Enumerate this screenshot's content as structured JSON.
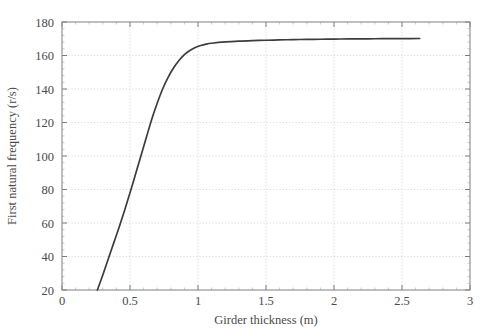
{
  "chart_data": {
    "type": "line",
    "title": "",
    "xlabel": "Girder thickness (m)",
    "ylabel": "First natural frequency (r/s)",
    "xlim": [
      0,
      3
    ],
    "ylim": [
      20,
      180
    ],
    "xticks": [
      "0",
      "0.5",
      "1",
      "1.5",
      "2",
      "2.5",
      "3"
    ],
    "xtick_values": [
      0,
      0.5,
      1,
      1.5,
      2,
      2.5,
      3
    ],
    "yticks": [
      "20",
      "40",
      "60",
      "80",
      "100",
      "120",
      "140",
      "160",
      "180"
    ],
    "ytick_values": [
      20,
      40,
      60,
      80,
      100,
      120,
      140,
      160,
      180
    ],
    "grid": true,
    "grid_style": "dotted",
    "legend": null,
    "series": [
      {
        "name": "First natural frequency",
        "x": [
          0.26,
          0.3,
          0.34,
          0.38,
          0.42,
          0.46,
          0.5,
          0.54,
          0.58,
          0.62,
          0.66,
          0.7,
          0.74,
          0.78,
          0.82,
          0.86,
          0.9,
          0.94,
          0.98,
          1.02,
          1.06,
          1.1,
          1.2,
          1.3,
          1.4,
          1.5,
          1.6,
          1.7,
          1.8,
          1.9,
          2.0,
          2.1,
          2.2,
          2.3,
          2.4,
          2.5,
          2.63
        ],
        "y": [
          20.0,
          29.0,
          38.5,
          48.0,
          57.5,
          67.5,
          78.0,
          89.0,
          100.0,
          111.0,
          122.0,
          131.5,
          140.0,
          147.0,
          152.5,
          157.0,
          160.5,
          163.0,
          164.8,
          166.0,
          166.8,
          167.3,
          168.1,
          168.6,
          168.9,
          169.1,
          169.3,
          169.5,
          169.6,
          169.7,
          169.8,
          169.9,
          169.95,
          170.0,
          170.05,
          170.1,
          170.15
        ]
      }
    ],
    "colors": {
      "curve": "#3d3d3d",
      "grid": "#c9c9c9",
      "frame": "#8a8a8a",
      "text": "#4a4a4a",
      "background": "#ffffff"
    },
    "notes": {
      "curve_start_x": 0.26,
      "curve_end_x": 2.63,
      "asymptote_y": 170,
      "minor_tick_count_x": 5,
      "minor_tick_count_y": 5
    }
  }
}
